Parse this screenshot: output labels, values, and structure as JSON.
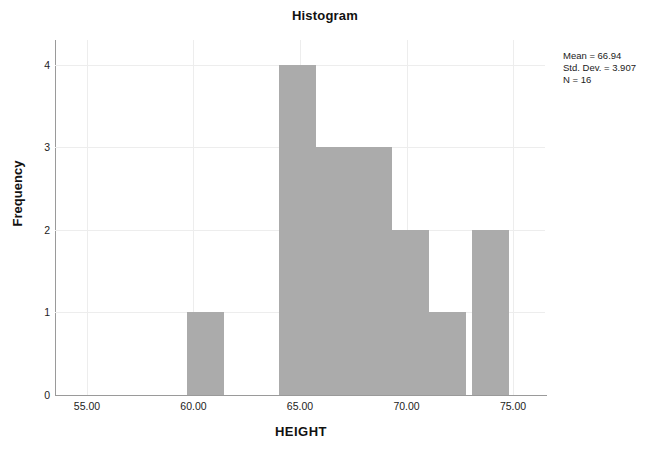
{
  "chart_data": {
    "type": "bar",
    "title": "Histogram",
    "xlabel": "HEIGHT",
    "ylabel": "Frequency",
    "xlim": [
      53.5,
      76.5
    ],
    "ylim": [
      0,
      4.3
    ],
    "xticks": [
      "55.00",
      "60.00",
      "65.00",
      "70.00",
      "75.00"
    ],
    "xtick_values": [
      55,
      60,
      65,
      70,
      75
    ],
    "yticks": [
      "0",
      "1",
      "2",
      "3",
      "4"
    ],
    "ytick_values": [
      0,
      1,
      2,
      3,
      4
    ],
    "grid": true,
    "legend": "none",
    "bin_width": 1.75,
    "bars": [
      {
        "bin_start": 59.7,
        "bin_end": 61.45,
        "value": 1
      },
      {
        "bin_start": 64.0,
        "bin_end": 65.75,
        "value": 4
      },
      {
        "bin_start": 65.75,
        "bin_end": 67.5,
        "value": 3
      },
      {
        "bin_start": 67.5,
        "bin_end": 69.3,
        "value": 3
      },
      {
        "bin_start": 69.3,
        "bin_end": 71.05,
        "value": 2
      },
      {
        "bin_start": 71.05,
        "bin_end": 72.8,
        "value": 1
      },
      {
        "bin_start": 73.05,
        "bin_end": 74.8,
        "value": 2
      }
    ],
    "categories": [
      "59.7-61.45",
      "64.0-65.75",
      "65.75-67.5",
      "67.5-69.3",
      "69.3-71.05",
      "71.05-72.8",
      "73.05-74.8"
    ],
    "values": [
      1,
      4,
      3,
      3,
      2,
      1,
      2
    ],
    "annotations": {
      "mean": "Mean = 66.94",
      "std_dev": "Std. Dev. = 3.907",
      "n": "N = 16"
    }
  },
  "colors": {
    "bar_fill": "#ababab",
    "axis": "#9a9a9a",
    "grid": "#ededed",
    "text": "#1a1a1a",
    "background": "#ffffff"
  }
}
